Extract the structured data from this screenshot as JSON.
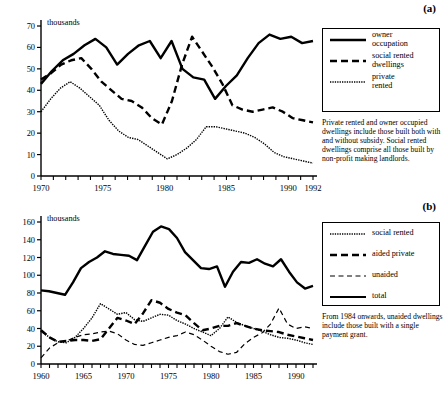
{
  "figure": {
    "panels": [
      {
        "id": "a",
        "letter": "(a)"
      },
      {
        "id": "b",
        "letter": "(b)"
      }
    ]
  },
  "panel_a": {
    "letter": "(a)",
    "unit_label": "thousands",
    "note": "Private rented and owner occupied dwellings include those built both with and without subsidy. Social rented dwellings comprise all those built by non-profit making landlords.",
    "legend": [
      {
        "label": "owner\noccupation",
        "style": "solid",
        "icon": "solid-line-swatch"
      },
      {
        "label": "social rented\ndwellings",
        "style": "dashed",
        "icon": "dashed-line-swatch"
      },
      {
        "label": "private\nrented",
        "style": "dotted",
        "icon": "dotted-line-swatch"
      }
    ]
  },
  "panel_b": {
    "letter": "(b)",
    "unit_label": "thousands",
    "note": "From 1984 onwards, unaided dwellings include those built with a single payment grant.",
    "legend": [
      {
        "label": "social rented",
        "style": "dotted",
        "icon": "dotted-line-swatch"
      },
      {
        "label": "aided private",
        "style": "dashed",
        "icon": "dashed-line-swatch"
      },
      {
        "label": "unaided",
        "style": "dashed-fine",
        "icon": "fine-dashed-line-swatch"
      },
      {
        "label": "total",
        "style": "solid",
        "icon": "solid-line-swatch"
      }
    ]
  },
  "chart_data": [
    {
      "type": "line",
      "id": "panel-a",
      "title": "",
      "xlabel": "",
      "ylabel": "thousands",
      "xlim": [
        1970,
        1992
      ],
      "ylim": [
        0,
        70
      ],
      "yticks": [
        0,
        10,
        20,
        30,
        40,
        50,
        60,
        70
      ],
      "xticks": [
        1970,
        1971,
        1972,
        1973,
        1974,
        1975,
        1976,
        1977,
        1978,
        1979,
        1980,
        1981,
        1982,
        1983,
        1984,
        1985,
        1986,
        1987,
        1988,
        1989,
        1990,
        1991,
        1992
      ],
      "xticklabels_shown": [
        "1970",
        "1975",
        "1980",
        "1985",
        "1990",
        "1992"
      ],
      "grid": false,
      "legend_position": "right",
      "x": [
        1970,
        1971,
        1972,
        1973,
        1974,
        1975,
        1976,
        1977,
        1978,
        1979,
        1980,
        1981,
        1982,
        1983,
        1984,
        1985,
        1986,
        1987,
        1988,
        1989,
        1990,
        1991,
        1992
      ],
      "series": [
        {
          "name": "owner occupation",
          "style": "solid",
          "values": [
            43,
            49,
            54,
            57,
            61,
            64,
            60,
            52,
            57,
            61,
            63,
            55,
            63,
            50,
            46,
            45,
            36,
            42,
            47,
            55,
            62,
            66,
            64,
            65,
            62,
            63
          ]
        },
        {
          "name": "social rented dwellings",
          "style": "dashed",
          "values": [
            45,
            48,
            52,
            54,
            55,
            50,
            44,
            40,
            36,
            35,
            32,
            27,
            24,
            35,
            52,
            65,
            58,
            51,
            43,
            33,
            31,
            30,
            31,
            32,
            30,
            27,
            26,
            25
          ]
        },
        {
          "name": "private rented",
          "style": "dotted",
          "values": [
            30,
            36,
            41,
            44,
            41,
            37,
            33,
            26,
            21,
            18,
            17,
            14,
            11,
            8,
            10,
            13,
            17,
            23,
            23,
            22,
            21,
            20,
            18,
            15,
            11,
            9,
            8,
            7,
            6
          ]
        }
      ]
    },
    {
      "type": "line",
      "id": "panel-b",
      "title": "",
      "xlabel": "",
      "ylabel": "thousands",
      "xlim": [
        1960,
        1992
      ],
      "ylim": [
        0,
        160
      ],
      "yticks": [
        0,
        20,
        40,
        60,
        80,
        100,
        120,
        140,
        160
      ],
      "xticks": [
        1960,
        1961,
        1962,
        1963,
        1964,
        1965,
        1966,
        1967,
        1968,
        1969,
        1970,
        1971,
        1972,
        1973,
        1974,
        1975,
        1976,
        1977,
        1978,
        1979,
        1980,
        1981,
        1982,
        1983,
        1984,
        1985,
        1986,
        1987,
        1988,
        1989,
        1990,
        1991,
        1992
      ],
      "xticklabels_shown": [
        "1960",
        "1965",
        "1970",
        "1975",
        "1980",
        "1985",
        "1990"
      ],
      "grid": false,
      "legend_position": "right",
      "x": [
        1960,
        1961,
        1962,
        1963,
        1964,
        1965,
        1966,
        1967,
        1968,
        1969,
        1970,
        1971,
        1972,
        1973,
        1974,
        1975,
        1976,
        1977,
        1978,
        1979,
        1980,
        1981,
        1982,
        1983,
        1984,
        1985,
        1986,
        1987,
        1988,
        1989,
        1990,
        1991,
        1992
      ],
      "series": [
        {
          "name": "total",
          "style": "solid",
          "values": [
            83,
            82,
            80,
            78,
            92,
            108,
            115,
            120,
            127,
            124,
            123,
            122,
            117,
            133,
            149,
            155,
            152,
            142,
            126,
            117,
            108,
            107,
            110,
            87,
            104,
            115,
            114,
            118,
            113,
            110,
            118,
            104,
            92,
            85,
            88
          ]
        },
        {
          "name": "social rented",
          "style": "dotted",
          "values": [
            37,
            30,
            25,
            24,
            30,
            40,
            52,
            68,
            62,
            56,
            58,
            50,
            48,
            52,
            56,
            55,
            49,
            45,
            40,
            36,
            32,
            40,
            53,
            47,
            43,
            40,
            37,
            33,
            30,
            29,
            27,
            24,
            22
          ]
        },
        {
          "name": "aided private",
          "style": "dashed",
          "values": [
            38,
            30,
            25,
            26,
            27,
            27,
            26,
            28,
            40,
            52,
            49,
            45,
            57,
            72,
            69,
            62,
            58,
            55,
            46,
            38,
            40,
            43,
            43,
            46,
            43,
            40,
            38,
            37,
            36,
            33,
            31,
            29,
            27
          ]
        },
        {
          "name": "unaided",
          "style": "dashed-fine",
          "values": [
            7,
            18,
            24,
            26,
            30,
            33,
            34,
            36,
            37,
            34,
            27,
            22,
            21,
            24,
            27,
            30,
            32,
            36,
            33,
            27,
            20,
            14,
            11,
            13,
            23,
            30,
            35,
            45,
            63,
            45,
            40,
            42,
            40
          ]
        }
      ]
    }
  ]
}
